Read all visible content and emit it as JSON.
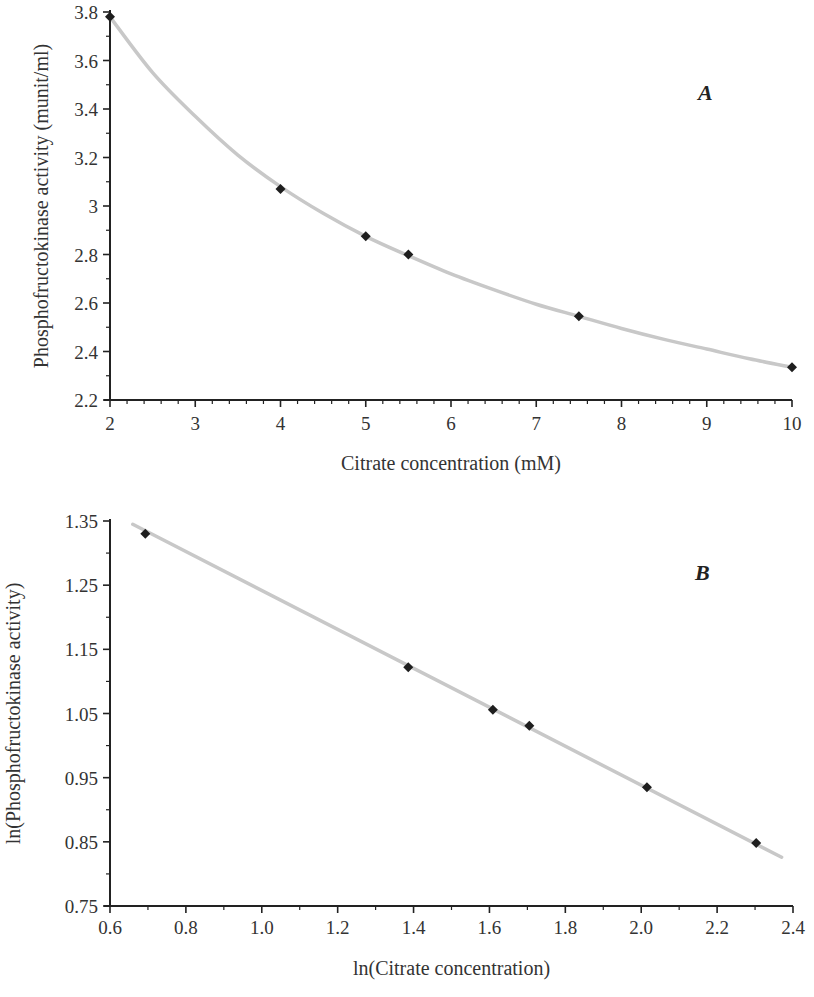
{
  "chart_data": [
    {
      "type": "scatter",
      "panel_label": "A",
      "title": "",
      "xlabel": "Citrate concentration (mM)",
      "ylabel": "Phosphofructokinase activity (munit/ml)",
      "xlim": [
        2,
        10
      ],
      "ylim": [
        2.2,
        3.8
      ],
      "x_ticks": [
        "2",
        "3",
        "4",
        "5",
        "6",
        "7",
        "8",
        "9",
        "10"
      ],
      "y_ticks": [
        "2.2",
        "2.4",
        "2.6",
        "2.8",
        "3",
        "3.2",
        "3.4",
        "3.6",
        "3.8"
      ],
      "grid": false,
      "legend": null,
      "series": [
        {
          "name": "measured",
          "marker": "diamond",
          "x": [
            2,
            4,
            5,
            5.5,
            7.5,
            10
          ],
          "y": [
            3.78,
            3.07,
            2.875,
            2.8,
            2.545,
            2.335
          ]
        },
        {
          "name": "fitted power curve",
          "style": "line",
          "color": "#c8c8c8",
          "x": [
            2,
            2.5,
            3,
            3.5,
            4,
            4.5,
            5,
            5.5,
            6,
            6.5,
            7,
            7.5,
            8,
            8.5,
            9,
            9.5,
            10
          ],
          "y": [
            3.78,
            3.55,
            3.37,
            3.21,
            3.08,
            2.97,
            2.875,
            2.795,
            2.72,
            2.655,
            2.595,
            2.545,
            2.495,
            2.45,
            2.41,
            2.37,
            2.335
          ]
        }
      ]
    },
    {
      "type": "scatter",
      "panel_label": "B",
      "title": "",
      "xlabel": "ln(Citrate concentration)",
      "ylabel": "ln(Phosphofructokinase activity)",
      "xlim": [
        0.6,
        2.4
      ],
      "ylim": [
        0.75,
        1.35
      ],
      "x_ticks": [
        "0.6",
        "0.8",
        "1.0",
        "1.2",
        "1.4",
        "1.6",
        "1.8",
        "2.0",
        "2.2",
        "2.4"
      ],
      "y_ticks": [
        "0.75",
        "0.85",
        "0.95",
        "1.05",
        "1.15",
        "1.25",
        "1.35"
      ],
      "grid": false,
      "legend": null,
      "series": [
        {
          "name": "measured",
          "marker": "diamond",
          "x": [
            0.693,
            1.386,
            1.609,
            1.705,
            2.015,
            2.303
          ],
          "y": [
            1.33,
            1.122,
            1.056,
            1.031,
            0.935,
            0.848
          ]
        },
        {
          "name": "linear fit",
          "style": "line",
          "color": "#c8c8c8",
          "x": [
            0.66,
            2.37
          ],
          "y": [
            1.345,
            0.826
          ]
        }
      ]
    }
  ]
}
